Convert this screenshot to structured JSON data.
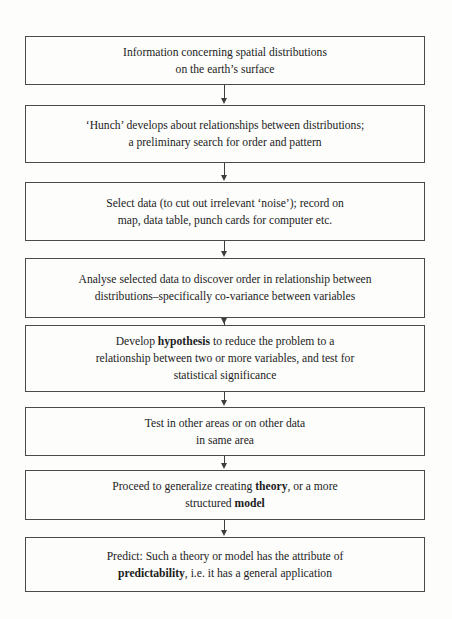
{
  "diagram": {
    "type": "flowchart",
    "orientation": "vertical",
    "arrow_count": 7,
    "colors": {
      "background": "#fdfdfb",
      "box_border": "#4a4a4a",
      "text": "#1c1c1c",
      "arrow": "#3d3d3d"
    },
    "boxes": [
      {
        "id": "information",
        "lines": [
          "Information concerning spatial distributions",
          "on the earth’s surface"
        ],
        "html": "Information concerning spatial distributions<br>on the earth’s surface",
        "top": 36,
        "height": 49
      },
      {
        "id": "hunch",
        "lines": [
          "‘Hunch’ develops about relationships between distributions;",
          "a preliminary search for order and pattern"
        ],
        "html": "‘Hunch’ develops about relationships between distributions;<br>a preliminary search for order and pattern",
        "top": 105,
        "height": 58
      },
      {
        "id": "select-data",
        "lines": [
          "Select data (to cut out irrelevant ‘noise’); record on",
          "map, data table, punch cards for computer etc."
        ],
        "html": "Select data (to cut out irrelevant ‘noise’); record on<br>map, data table, punch cards for computer etc.",
        "top": 182,
        "height": 59
      },
      {
        "id": "analyse",
        "lines": [
          "Analyse selected data to discover order in relationship between",
          "distributions–specifically co-variance between variables"
        ],
        "html": "Analyse selected data to discover order in relationship between<br>distributions–specifically co-variance between variables",
        "top": 258,
        "height": 60
      },
      {
        "id": "hypothesis",
        "lines": [
          "Develop hypothesis to reduce the problem to a",
          "relationship between two or more variables, and test for",
          "statistical significance"
        ],
        "html": "Develop <b>hypothesis</b> to reduce the problem to a<br>relationship between two or more variables, and test for<br>statistical significance",
        "bold_terms": [
          "hypothesis"
        ],
        "top": 325,
        "height": 67
      },
      {
        "id": "test",
        "lines": [
          "Test in other areas or on other data",
          "in same area"
        ],
        "html": "Test in other areas or on other data<br>in same area",
        "top": 407,
        "height": 49
      },
      {
        "id": "generalize",
        "lines": [
          "Proceed to generalize creating theory, or a more",
          "structured model"
        ],
        "html": "Proceed to generalize creating <b>theory</b>, or a more<br>structured <b>model</b>",
        "bold_terms": [
          "theory",
          "model"
        ],
        "top": 470,
        "height": 50
      },
      {
        "id": "predict",
        "lines": [
          "Predict: Such a theory or model has the attribute of",
          "predictability, i.e. it has a general application"
        ],
        "html": "Predict: Such a theory or model has the attribute of<br><b>predictability</b>, i.e. it has a general application",
        "bold_terms": [
          "predictability"
        ],
        "top": 537,
        "height": 55
      }
    ]
  }
}
